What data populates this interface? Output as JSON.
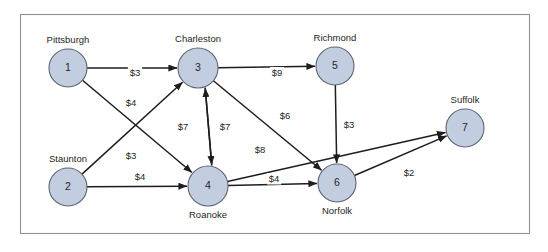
{
  "diagram": {
    "type": "directed-network-graph",
    "title": "",
    "frame": {
      "x": 20,
      "y": 14,
      "width": 510,
      "height": 220,
      "border_color": "#8e9196"
    },
    "node_fill_color": "#c3cde0",
    "node_stroke_color": "#5d6470",
    "edge_color": "#1d1d1d",
    "nodes": [
      {
        "id": "1",
        "label": "Pittsburgh",
        "cx": 68,
        "cy": 68,
        "r": 19,
        "label_pos": "above"
      },
      {
        "id": "2",
        "label": "Staunton",
        "cx": 68,
        "cy": 187,
        "r": 19,
        "label_pos": "above"
      },
      {
        "id": "3",
        "label": "Charleston",
        "cx": 198,
        "cy": 68,
        "r": 20,
        "label_pos": "above"
      },
      {
        "id": "4",
        "label": "Roanoke",
        "cx": 208,
        "cy": 186,
        "r": 20,
        "label_pos": "below"
      },
      {
        "id": "5",
        "label": "Richmond",
        "cx": 335,
        "cy": 66,
        "r": 19,
        "label_pos": "above"
      },
      {
        "id": "6",
        "label": "Norfolk",
        "cx": 337,
        "cy": 183,
        "r": 19,
        "label_pos": "below"
      },
      {
        "id": "7",
        "label": "Suffolk",
        "cx": 465,
        "cy": 128,
        "r": 19,
        "label_pos": "above"
      }
    ],
    "edges": [
      {
        "from": "1",
        "to": "3",
        "label": "$3",
        "label_x": 135,
        "label_y": 76
      },
      {
        "from": "1",
        "to": "4",
        "label": "$4",
        "label_x": 131,
        "label_y": 106
      },
      {
        "from": "2",
        "to": "3",
        "label": "$3",
        "label_x": 131,
        "label_y": 159
      },
      {
        "from": "2",
        "to": "4",
        "label": "$4",
        "label_x": 140,
        "label_y": 180
      },
      {
        "from": "3",
        "to": "4",
        "label": "$7",
        "label_x": 183,
        "label_y": 130
      },
      {
        "from": "4",
        "to": "3",
        "label": "$7",
        "label_x": 225,
        "label_y": 130
      },
      {
        "from": "3",
        "to": "5",
        "label": "$9",
        "label_x": 277,
        "label_y": 76
      },
      {
        "from": "3",
        "to": "6",
        "label": "$6",
        "label_x": 285,
        "label_y": 119
      },
      {
        "from": "5",
        "to": "6",
        "label": "$3",
        "label_x": 349,
        "label_y": 128
      },
      {
        "from": "4",
        "to": "6",
        "label": "$4",
        "label_x": 274,
        "label_y": 182
      },
      {
        "from": "4",
        "to": "7",
        "label": "$8",
        "label_x": 260,
        "label_y": 153
      },
      {
        "from": "6",
        "to": "7",
        "label": "$2",
        "label_x": 409,
        "label_y": 176
      }
    ]
  }
}
